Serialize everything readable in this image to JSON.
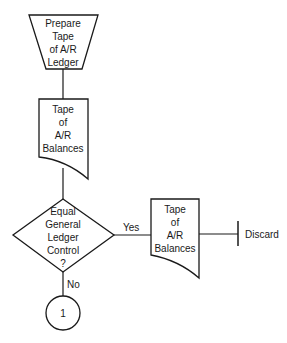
{
  "diagram": {
    "type": "flowchart",
    "colors": {
      "stroke": "#1a1a1a",
      "background": "#ffffff"
    },
    "nodes": [
      {
        "id": "prepare",
        "shape": "manual-operation",
        "lines": [
          "Prepare",
          "Tape",
          "of A/R",
          "Ledger"
        ]
      },
      {
        "id": "tape1",
        "shape": "document",
        "lines": [
          "Tape",
          "of",
          "A/R",
          "Balances"
        ]
      },
      {
        "id": "decision",
        "shape": "decision",
        "lines": [
          "Equal",
          "General",
          "Ledger",
          "Control",
          "?"
        ]
      },
      {
        "id": "tape2",
        "shape": "document",
        "lines": [
          "Tape",
          "of",
          "A/R",
          "Balances"
        ]
      },
      {
        "id": "discard",
        "shape": "terminal-bar",
        "label": "Discard"
      },
      {
        "id": "connector1",
        "shape": "connector",
        "label": "1"
      }
    ],
    "edges": [
      {
        "from": "prepare",
        "to": "tape1",
        "label": ""
      },
      {
        "from": "tape1",
        "to": "decision",
        "label": ""
      },
      {
        "from": "decision",
        "to": "tape2",
        "label": "Yes"
      },
      {
        "from": "tape2",
        "to": "discard",
        "label": ""
      },
      {
        "from": "decision",
        "to": "connector1",
        "label": "No"
      }
    ]
  }
}
